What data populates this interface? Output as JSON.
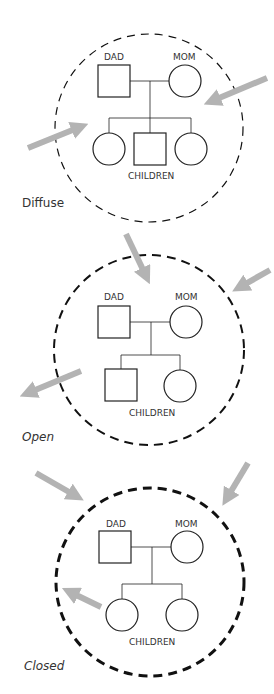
{
  "diagrams": [
    {
      "id": "diffuse",
      "caption": "Diffuse",
      "dad_label": "DAD",
      "mom_label": "MOM",
      "children_label": "CHILDREN",
      "children": [
        "female",
        "male",
        "female"
      ],
      "boundary_style": "thin-dashed"
    },
    {
      "id": "open",
      "caption": "Open",
      "dad_label": "DAD",
      "mom_label": "MOM",
      "children_label": "CHILDREN",
      "children": [
        "male",
        "female"
      ],
      "boundary_style": "medium-dashed"
    },
    {
      "id": "closed",
      "caption": "Closed",
      "dad_label": "DAD",
      "mom_label": "MOM",
      "children_label": "CHILDREN",
      "children": [
        "female",
        "female"
      ],
      "boundary_style": "thick-dashed"
    }
  ],
  "colors": {
    "arrow": "#b3b3b3",
    "line": "#222222",
    "boundary": "#111111"
  }
}
